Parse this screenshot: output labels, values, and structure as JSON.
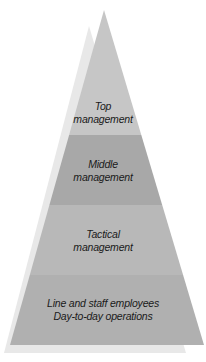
{
  "diagram": {
    "type": "pyramid",
    "levels": [
      {
        "line1": "Top",
        "line2": "management",
        "color": "#c4c4c4"
      },
      {
        "line1": "Middle",
        "line2": "management",
        "color": "#a9a9a9"
      },
      {
        "line1": "Tactical",
        "line2": "management",
        "color": "#b9b9b9"
      },
      {
        "line1": "Line and staff employees",
        "line2": "Day-to-day operations",
        "color": "#b0b0b0"
      }
    ],
    "shadow_color": "#e6e6e6"
  }
}
